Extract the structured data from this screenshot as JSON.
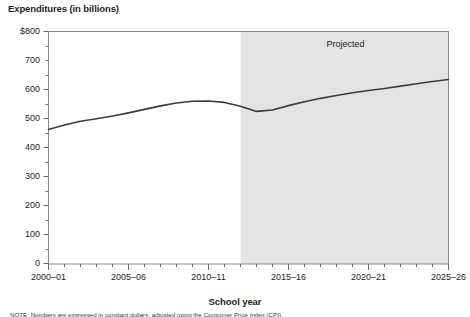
{
  "chart_data": {
    "type": "line",
    "title": "",
    "ylabel": "Expenditures (in billions)",
    "xlabel": "School year",
    "ylim": [
      0,
      800
    ],
    "ytick_values": [
      0,
      100,
      200,
      300,
      400,
      500,
      600,
      700,
      800
    ],
    "ytick_labels": [
      "0",
      "100",
      "200",
      "300",
      "400",
      "500",
      "600",
      "700",
      "$800"
    ],
    "xtick_labels": [
      "2000–01",
      "2005–06",
      "2010–11",
      "2015–16",
      "2020–21",
      "2025–26"
    ],
    "xtick_years": [
      2000,
      2005,
      2010,
      2015,
      2020,
      2025
    ],
    "x_range": [
      2000,
      2025
    ],
    "grid": false,
    "legend": "none",
    "annotations": [
      {
        "text": "Projected",
        "x_year": 2019,
        "y_value": 755
      }
    ],
    "shaded_region": {
      "label": "Projected",
      "start_year": 2012,
      "end_year": 2025,
      "color": "#e3e3e3"
    },
    "line_color": "#3b3b3b",
    "series": [
      {
        "name": "Expenditures",
        "x": [
          2000,
          2001,
          2002,
          2003,
          2004,
          2005,
          2006,
          2007,
          2008,
          2009,
          2010,
          2011,
          2012,
          2013,
          2014,
          2015,
          2016,
          2017,
          2018,
          2019,
          2020,
          2021,
          2022,
          2023,
          2024,
          2025
        ],
        "values": [
          463,
          478,
          491,
          500,
          509,
          520,
          532,
          544,
          554,
          560,
          561,
          556,
          543,
          525,
          530,
          545,
          558,
          570,
          580,
          589,
          597,
          604,
          612,
          620,
          628,
          635
        ]
      }
    ]
  },
  "axes": {
    "y_title": "Expenditures (in billions)",
    "x_title": "School year"
  },
  "footnote": {
    "text": "NOTE: Numbers are expressed in constant dollars, adjusted using the Consumer Price Index (CPI)."
  }
}
